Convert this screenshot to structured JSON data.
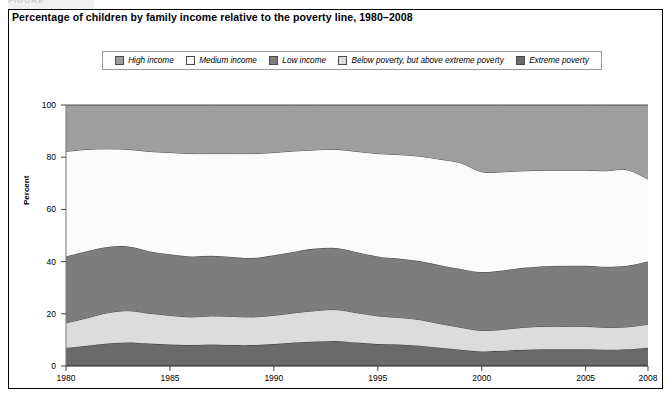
{
  "figure_tag": "FIGURE",
  "title": "Percentage of children by family income relative to the poverty line, 1980–2008",
  "legend": {
    "items": [
      {
        "label": "High income",
        "color": "#9e9e9e"
      },
      {
        "label": "Medium income",
        "color": "#fbfbfb"
      },
      {
        "label": "Low income",
        "color": "#7d7d7d"
      },
      {
        "label": "Below poverty, but above extreme poverty",
        "color": "#dcdcdc"
      },
      {
        "label": "Extreme poverty",
        "color": "#6a6a6a"
      }
    ]
  },
  "axes": {
    "ylabel": "Percent",
    "yticks": [
      "0",
      "20",
      "40",
      "60",
      "80",
      "100"
    ],
    "xticks": [
      "1980",
      "1985",
      "1990",
      "1995",
      "2000",
      "2005",
      "2008"
    ]
  },
  "chart_data": {
    "type": "area",
    "title": "Percentage of children by family income relative to the poverty line, 1980–2008",
    "xlabel": "",
    "ylabel": "Percent",
    "ylim": [
      0,
      100
    ],
    "xlim": [
      1980,
      2008
    ],
    "grid": false,
    "stacked": true,
    "legend_position": "top",
    "x": [
      1980,
      1981,
      1982,
      1983,
      1984,
      1985,
      1986,
      1987,
      1988,
      1989,
      1990,
      1991,
      1992,
      1993,
      1994,
      1995,
      1996,
      1997,
      1998,
      1999,
      2000,
      2001,
      2002,
      2003,
      2004,
      2005,
      2006,
      2007,
      2008
    ],
    "series": [
      {
        "name": "Extreme poverty",
        "color": "#6a6a6a",
        "values": [
          7.0,
          7.8,
          8.6,
          9.0,
          8.6,
          8.2,
          8.0,
          8.2,
          8.0,
          8.0,
          8.4,
          9.0,
          9.4,
          9.6,
          9.0,
          8.4,
          8.2,
          7.8,
          7.0,
          6.2,
          5.6,
          5.8,
          6.2,
          6.4,
          6.4,
          6.4,
          6.2,
          6.4,
          7.0
        ]
      },
      {
        "name": "Below poverty, but above extreme poverty",
        "color": "#dcdcdc",
        "values": [
          9.5,
          10.6,
          11.8,
          12.2,
          11.6,
          11.2,
          10.8,
          11.0,
          11.0,
          10.8,
          11.0,
          11.4,
          11.8,
          12.0,
          11.4,
          10.8,
          10.4,
          10.0,
          9.2,
          8.6,
          8.0,
          8.2,
          8.6,
          8.8,
          8.8,
          8.8,
          8.6,
          8.6,
          9.0
        ]
      },
      {
        "name": "Low income",
        "color": "#7d7d7d",
        "values": [
          25.5,
          25.6,
          25.2,
          24.6,
          23.8,
          23.4,
          23.2,
          23.0,
          22.8,
          22.6,
          23.0,
          23.4,
          23.8,
          23.6,
          23.2,
          22.8,
          22.6,
          22.4,
          22.4,
          22.4,
          22.4,
          22.6,
          22.8,
          23.0,
          23.2,
          23.2,
          23.2,
          23.4,
          24.0
        ]
      },
      {
        "name": "Medium income",
        "color": "#fbfbfb",
        "values": [
          40.2,
          39.0,
          37.6,
          37.2,
          38.2,
          39.0,
          39.4,
          39.2,
          39.6,
          40.0,
          39.4,
          38.6,
          37.8,
          37.8,
          38.6,
          39.4,
          39.8,
          40.2,
          40.6,
          40.6,
          38.4,
          37.8,
          37.2,
          36.8,
          36.6,
          36.6,
          36.8,
          36.8,
          31.6
        ]
      },
      {
        "name": "High income",
        "color": "#9e9e9e",
        "values": [
          17.8,
          17.0,
          16.8,
          17.0,
          17.8,
          18.2,
          18.6,
          18.6,
          18.6,
          18.6,
          18.2,
          17.6,
          17.2,
          17.0,
          17.8,
          18.6,
          19.0,
          19.6,
          20.8,
          22.2,
          25.6,
          25.6,
          25.2,
          25.0,
          25.0,
          25.0,
          25.2,
          24.8,
          28.4
        ]
      }
    ],
    "cumulative_tops": {
      "note": "upper boundary of each stacked band, percent",
      "extreme_poverty": [
        7.0,
        7.8,
        8.6,
        9.0,
        8.6,
        8.2,
        8.0,
        8.2,
        8.0,
        8.0,
        8.4,
        9.0,
        9.4,
        9.6,
        9.0,
        8.4,
        8.2,
        7.8,
        7.0,
        6.2,
        5.6,
        5.8,
        6.2,
        6.4,
        6.4,
        6.4,
        6.2,
        6.4,
        7.0
      ],
      "below_poverty": [
        16.5,
        18.4,
        20.4,
        21.2,
        20.2,
        19.4,
        18.8,
        19.2,
        19.0,
        18.8,
        19.4,
        20.4,
        21.2,
        21.6,
        20.4,
        19.2,
        18.6,
        17.8,
        16.2,
        14.8,
        13.6,
        14.0,
        14.8,
        15.2,
        15.2,
        15.2,
        14.8,
        15.0,
        16.0
      ],
      "low_income": [
        42.0,
        44.0,
        45.6,
        45.8,
        44.0,
        42.8,
        42.0,
        42.2,
        41.8,
        41.4,
        42.4,
        43.8,
        45.0,
        45.2,
        43.6,
        42.0,
        41.2,
        40.2,
        38.6,
        37.2,
        36.0,
        36.6,
        37.6,
        38.2,
        38.4,
        38.4,
        38.0,
        38.4,
        40.0
      ],
      "medium_income": [
        82.2,
        83.0,
        83.2,
        83.0,
        82.2,
        81.8,
        81.4,
        81.4,
        81.4,
        81.4,
        81.8,
        82.4,
        82.8,
        83.0,
        82.2,
        81.4,
        81.0,
        80.4,
        79.2,
        77.8,
        74.4,
        74.4,
        74.8,
        75.0,
        75.0,
        75.0,
        74.8,
        75.2,
        71.6
      ],
      "high_income": [
        100,
        100,
        100,
        100,
        100,
        100,
        100,
        100,
        100,
        100,
        100,
        100,
        100,
        100,
        100,
        100,
        100,
        100,
        100,
        100,
        100,
        100,
        100,
        100,
        100,
        100,
        100,
        100,
        100
      ]
    }
  }
}
